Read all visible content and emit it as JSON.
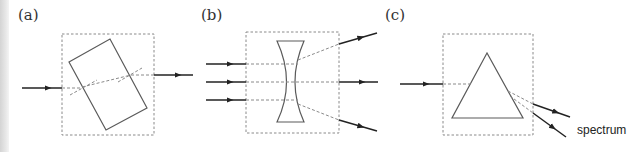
{
  "figure": {
    "panels": [
      {
        "id": "a",
        "label": "(a)",
        "object": "rectangular glass block",
        "rays_in": 1,
        "rays_out": 1
      },
      {
        "id": "b",
        "label": "(b)",
        "object": "concave (diverging) lens",
        "rays_in": 3,
        "rays_out": 3
      },
      {
        "id": "c",
        "label": "(c)",
        "object": "triangular prism",
        "rays_in": 1,
        "rays_out": 2,
        "output_caption": "spectrum"
      }
    ],
    "colors": {
      "ray": "#222222",
      "box": "#8a8a8a",
      "shape": "#5a5a5a"
    }
  }
}
